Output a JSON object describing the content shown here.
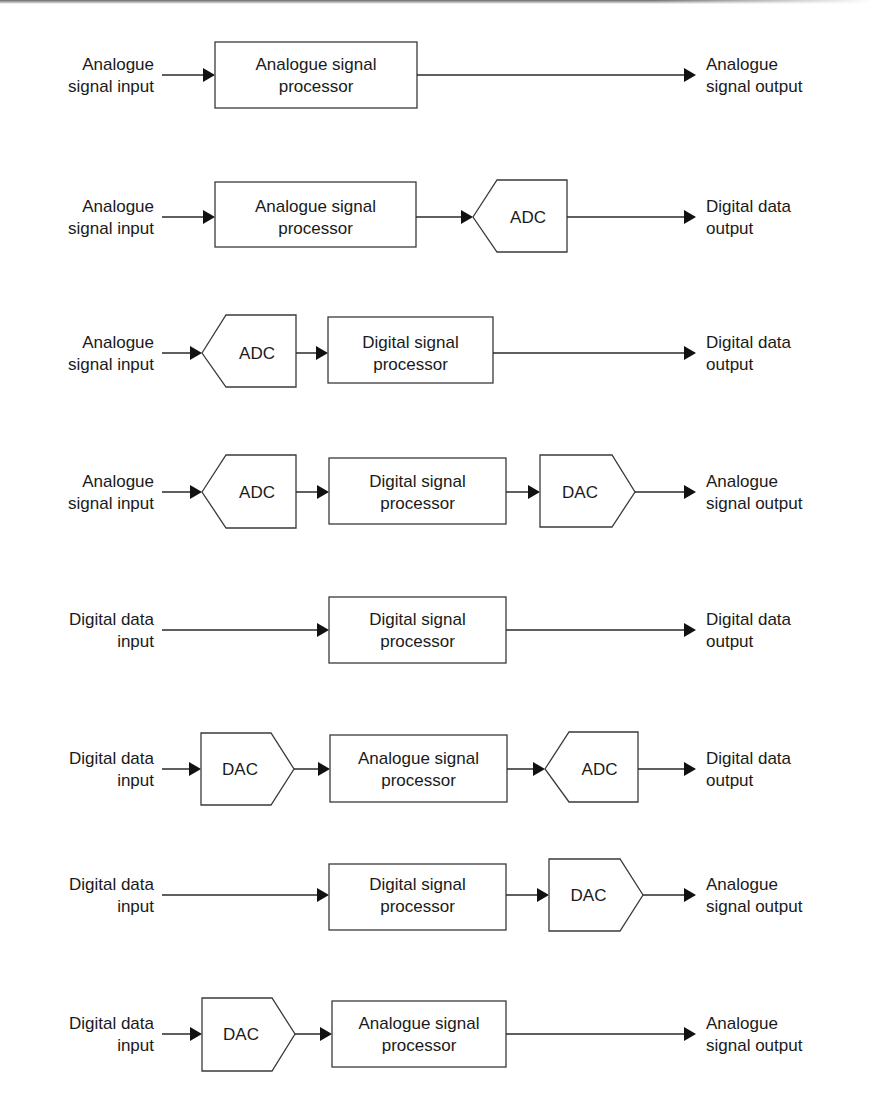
{
  "diagram": {
    "colors": {
      "stroke": "#3a3a3a",
      "arrow": "#111111",
      "text": "#1a1a1a",
      "background": "#ffffff"
    },
    "rows": [
      {
        "y": 75,
        "input": {
          "lines": [
            "Analogue",
            "signal input"
          ]
        },
        "output": {
          "lines": [
            "Analogue",
            "signal output"
          ]
        },
        "blocks": [
          {
            "type": "box",
            "x1": 215,
            "x2": 417,
            "top": 42,
            "bottom": 108,
            "lines": [
              "Analogue signal",
              "processor"
            ]
          }
        ]
      },
      {
        "y": 217,
        "input": {
          "lines": [
            "Analogue",
            "signal input"
          ]
        },
        "output": {
          "lines": [
            "Digital data",
            "output"
          ]
        },
        "blocks": [
          {
            "type": "box",
            "x1": 215,
            "x2": 416,
            "top": 182,
            "bottom": 247,
            "lines": [
              "Analogue signal",
              "processor"
            ]
          },
          {
            "type": "adc",
            "x1": 473,
            "x2": 567,
            "top": 180,
            "bottom": 252,
            "lines": [
              "ADC"
            ]
          }
        ]
      },
      {
        "y": 353,
        "input": {
          "lines": [
            "Analogue",
            "signal input"
          ]
        },
        "output": {
          "lines": [
            "Digital data",
            "output"
          ]
        },
        "blocks": [
          {
            "type": "adc",
            "x1": 202,
            "x2": 296,
            "top": 315,
            "bottom": 387,
            "lines": [
              "ADC"
            ]
          },
          {
            "type": "box",
            "x1": 328,
            "x2": 493,
            "top": 317,
            "bottom": 383,
            "lines": [
              "Digital signal",
              "processor"
            ]
          }
        ]
      },
      {
        "y": 492,
        "input": {
          "lines": [
            "Analogue",
            "signal input"
          ]
        },
        "output": {
          "lines": [
            "Analogue",
            "signal output"
          ]
        },
        "blocks": [
          {
            "type": "adc",
            "x1": 202,
            "x2": 296,
            "top": 455,
            "bottom": 528,
            "lines": [
              "ADC"
            ]
          },
          {
            "type": "box",
            "x1": 329,
            "x2": 506,
            "top": 458,
            "bottom": 524,
            "lines": [
              "Digital signal",
              "processor"
            ]
          },
          {
            "type": "dac",
            "x1": 540,
            "x2": 635,
            "top": 455,
            "bottom": 527,
            "lines": [
              "DAC"
            ]
          }
        ]
      },
      {
        "y": 630,
        "input": {
          "lines": [
            "Digital data",
            "input"
          ]
        },
        "output": {
          "lines": [
            "Digital data",
            "output"
          ]
        },
        "blocks": [
          {
            "type": "box",
            "x1": 329,
            "x2": 506,
            "top": 597,
            "bottom": 663,
            "lines": [
              "Digital signal",
              "processor"
            ]
          }
        ]
      },
      {
        "y": 769,
        "input": {
          "lines": [
            "Digital data",
            "input"
          ]
        },
        "output": {
          "lines": [
            "Digital data",
            "output"
          ]
        },
        "blocks": [
          {
            "type": "dac",
            "x1": 201,
            "x2": 294,
            "top": 733,
            "bottom": 805,
            "lines": [
              "DAC"
            ]
          },
          {
            "type": "box",
            "x1": 330,
            "x2": 507,
            "top": 735,
            "bottom": 802,
            "lines": [
              "Analogue signal",
              "processor"
            ]
          },
          {
            "type": "adc",
            "x1": 545,
            "x2": 638,
            "top": 732,
            "bottom": 802,
            "lines": [
              "ADC"
            ]
          }
        ]
      },
      {
        "y": 895,
        "input": {
          "lines": [
            "Digital data",
            "input"
          ]
        },
        "output": {
          "lines": [
            "Analogue",
            "signal output"
          ]
        },
        "blocks": [
          {
            "type": "box",
            "x1": 329,
            "x2": 506,
            "top": 864,
            "bottom": 930,
            "lines": [
              "Digital signal",
              "processor"
            ]
          },
          {
            "type": "dac",
            "x1": 549,
            "x2": 643,
            "top": 859,
            "bottom": 931,
            "lines": [
              "DAC"
            ]
          }
        ]
      },
      {
        "y": 1034,
        "input": {
          "lines": [
            "Digital data",
            "input"
          ]
        },
        "output": {
          "lines": [
            "Analogue",
            "signal output"
          ]
        },
        "blocks": [
          {
            "type": "dac",
            "x1": 202,
            "x2": 295,
            "top": 998,
            "bottom": 1071,
            "lines": [
              "DAC"
            ]
          },
          {
            "type": "box",
            "x1": 332,
            "x2": 506,
            "top": 1001,
            "bottom": 1067,
            "lines": [
              "Analogue signal",
              "processor"
            ]
          }
        ]
      }
    ],
    "layout": {
      "input_label_right_x": 154,
      "input_wire_start_x": 162,
      "output_arrow_tip_x": 696,
      "output_label_x": 706,
      "font_size": 17,
      "line_height": 22
    }
  }
}
